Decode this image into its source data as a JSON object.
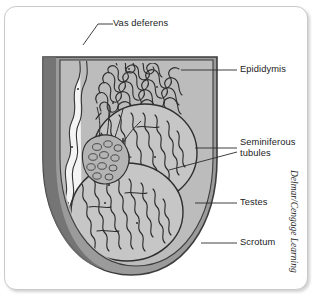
{
  "figure": {
    "attribution": "Delmar/Cengage Learning",
    "colors": {
      "card_background": "#ffffff",
      "card_border": "#c9c9c9",
      "scrotum_wall": "#9a9a9a",
      "scrotum_outline": "#4a4a4a",
      "scrotum_interior": "#b9b9b9",
      "testis_fill": "#c6c6c6",
      "tubule_fill": "#f2f2f2",
      "tubule_outline": "#303030",
      "vas_deferens_fill": "#f4f4f4",
      "label_text": "#1c1c1c",
      "leader_line": "#2b2b2b"
    },
    "labels": [
      {
        "id": "vas-deferens",
        "text": "Vas deferens",
        "line2": ""
      },
      {
        "id": "epididymis",
        "text": "Epididymis",
        "line2": ""
      },
      {
        "id": "seminiferous-tubules",
        "text": "Seminiferous",
        "line2": "tubules"
      },
      {
        "id": "testes",
        "text": "Testes",
        "line2": ""
      },
      {
        "id": "scrotum",
        "text": "Scrotum",
        "line2": ""
      }
    ]
  }
}
